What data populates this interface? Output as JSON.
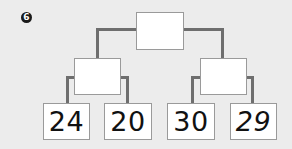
{
  "question": {
    "number_label": "6"
  },
  "tree": {
    "root": {
      "value": ""
    },
    "middle": [
      {
        "value": ""
      },
      {
        "value": ""
      }
    ],
    "leaves": [
      {
        "value": "24"
      },
      {
        "value": "20"
      },
      {
        "value": "30"
      },
      {
        "value": "29"
      }
    ]
  },
  "colors": {
    "background": "#ececec",
    "box_fill": "#ffffff",
    "box_border": "#9a9a9a",
    "connector": "#6e6e6e",
    "text": "#111111"
  }
}
